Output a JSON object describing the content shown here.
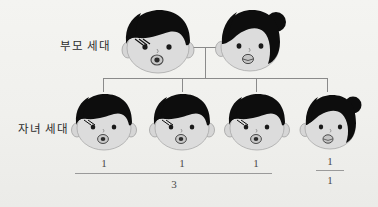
{
  "diagram": {
    "background_color": "#f1f1ee",
    "line_color": "#8a8a8a",
    "hair_color": "#101010",
    "skin_color": "#d9d9d9"
  },
  "labels": {
    "parent_generation": "부모 세대",
    "child_generation": "자녀 세대"
  },
  "parents": [
    {
      "id": "father",
      "role": "father",
      "sex": "male",
      "hair": "bowl-cut",
      "name": "father-figure"
    },
    {
      "id": "mother",
      "role": "mother",
      "sex": "female",
      "hair": "bun",
      "name": "mother-figure"
    }
  ],
  "children": [
    {
      "id": "child-1",
      "sex": "male",
      "hair": "bowl-cut",
      "count": "1"
    },
    {
      "id": "child-2",
      "sex": "male",
      "hair": "bowl-cut",
      "count": "1"
    },
    {
      "id": "child-3",
      "sex": "male",
      "hair": "bowl-cut",
      "count": "1"
    },
    {
      "id": "child-4",
      "sex": "female",
      "hair": "bun",
      "count": "1"
    }
  ],
  "ratio": {
    "group_left_total": "3",
    "group_right_numerator": "1",
    "group_right_denominator": "1"
  }
}
